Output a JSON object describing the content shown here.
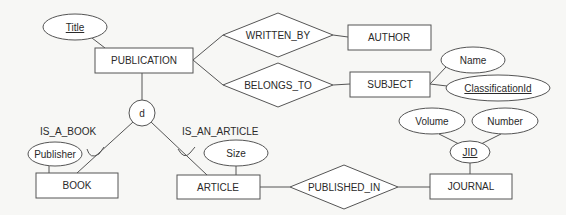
{
  "diagram": {
    "type": "EER diagram",
    "entities": [
      {
        "id": "publication",
        "label": "PUBLICATION",
        "x": 95,
        "y": 48,
        "w": 98,
        "h": 25
      },
      {
        "id": "author",
        "label": "AUTHOR",
        "x": 348,
        "y": 25,
        "w": 83,
        "h": 25
      },
      {
        "id": "subject",
        "label": "SUBJECT",
        "x": 350,
        "y": 72,
        "w": 80,
        "h": 25
      },
      {
        "id": "book",
        "label": "BOOK",
        "x": 36,
        "y": 173,
        "w": 82,
        "h": 25
      },
      {
        "id": "article",
        "label": "ARTICLE",
        "x": 177,
        "y": 175,
        "w": 83,
        "h": 24
      },
      {
        "id": "journal",
        "label": "JOURNAL",
        "x": 430,
        "y": 174,
        "w": 82,
        "h": 25
      }
    ],
    "relationships": [
      {
        "id": "written_by",
        "label": "WRITTEN_BY",
        "cx": 278,
        "cy": 35,
        "hw": 55,
        "hh": 22
      },
      {
        "id": "belongs_to",
        "label": "BELONGS_TO",
        "cx": 278,
        "cy": 85,
        "hw": 55,
        "hh": 22
      },
      {
        "id": "published_in",
        "label": "PUBLISHED_IN",
        "cx": 344,
        "cy": 187,
        "hw": 54,
        "hh": 22
      }
    ],
    "attributes": [
      {
        "id": "title",
        "label": "Title",
        "key": true,
        "cx": 75,
        "cy": 27,
        "rx": 32,
        "ry": 13
      },
      {
        "id": "name",
        "label": "Name",
        "key": false,
        "cx": 473,
        "cy": 60,
        "rx": 32,
        "ry": 13
      },
      {
        "id": "classification_id",
        "label": "ClassificationId",
        "key": true,
        "cx": 498,
        "cy": 88,
        "rx": 52,
        "ry": 13
      },
      {
        "id": "publisher",
        "label": "Publisher",
        "key": false,
        "cx": 55,
        "cy": 154,
        "rx": 27,
        "ry": 12
      },
      {
        "id": "size",
        "label": "Size",
        "key": false,
        "cx": 236,
        "cy": 153,
        "rx": 32,
        "ry": 13
      },
      {
        "id": "jid",
        "label": "JID",
        "key": true,
        "cx": 470,
        "cy": 152,
        "rx": 20,
        "ry": 11
      },
      {
        "id": "volume",
        "label": "Volume",
        "key": false,
        "cx": 432,
        "cy": 121,
        "rx": 33,
        "ry": 13
      },
      {
        "id": "number",
        "label": "Number",
        "key": false,
        "cx": 505,
        "cy": 121,
        "rx": 33,
        "ry": 13
      }
    ],
    "specialization": {
      "symbol": "d",
      "cx": 142,
      "cy": 113,
      "r": 13,
      "labels": [
        {
          "id": "is_a_book",
          "label": "IS_A_BOOK",
          "x": 40,
          "y": 132
        },
        {
          "id": "is_an_article",
          "label": "IS_AN_ARTICLE",
          "x": 182,
          "y": 132
        }
      ]
    }
  }
}
